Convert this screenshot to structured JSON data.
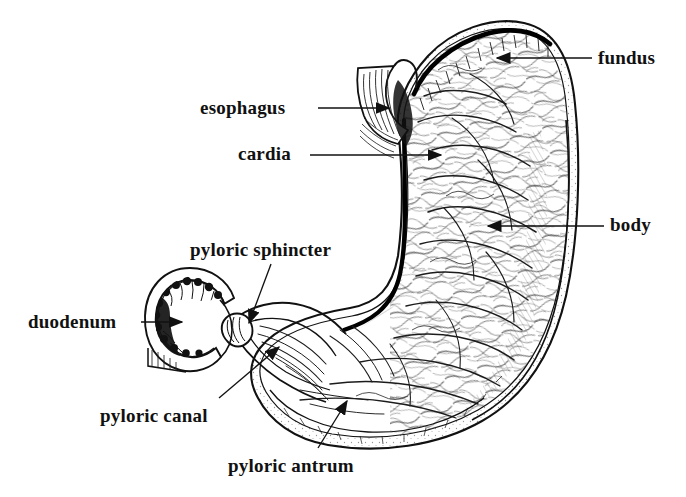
{
  "figure": {
    "background_color": "#ffffff",
    "ink_color": "#111111",
    "style": "black-and-white engraved line drawing with hatching and stippling"
  },
  "labels": [
    {
      "id": "fundus",
      "text": "fundus",
      "x": 598,
      "y": 48,
      "align": "left",
      "leader": {
        "from_x": 592,
        "from_y": 58,
        "to_x": 495,
        "to_y": 58,
        "arrow": "left"
      }
    },
    {
      "id": "esophagus",
      "text": "esophagus",
      "x": 200,
      "y": 98,
      "align": "left",
      "leader": {
        "from_x": 318,
        "from_y": 108,
        "to_x": 391,
        "to_y": 108,
        "arrow": "right"
      }
    },
    {
      "id": "cardia",
      "text": "cardia",
      "x": 238,
      "y": 144,
      "align": "left",
      "leader": {
        "from_x": 310,
        "from_y": 155,
        "to_x": 443,
        "to_y": 155,
        "arrow": "right"
      }
    },
    {
      "id": "body",
      "text": "body",
      "x": 610,
      "y": 215,
      "align": "left",
      "leader": {
        "from_x": 604,
        "from_y": 226,
        "to_x": 486,
        "to_y": 226,
        "arrow": "left"
      }
    },
    {
      "id": "pyloric-sphincter",
      "text": "pyloric sphincter",
      "x": 190,
      "y": 240,
      "align": "left",
      "leader": {
        "from_x": 271,
        "from_y": 264,
        "to_x": 247,
        "to_y": 326,
        "arrow": "down-left"
      }
    },
    {
      "id": "duodenum",
      "text": "duodenum",
      "x": 28,
      "y": 312,
      "align": "left",
      "leader": {
        "from_x": 141,
        "from_y": 322,
        "to_x": 184,
        "to_y": 322,
        "arrow": "right"
      }
    },
    {
      "id": "pyloric-canal",
      "text": "pyloric canal",
      "x": 100,
      "y": 406,
      "align": "left",
      "leader": {
        "from_x": 219,
        "from_y": 398,
        "to_x": 281,
        "to_y": 344,
        "arrow": "up-right"
      }
    },
    {
      "id": "pyloric-antrum",
      "text": "pyloric antrum",
      "x": 228,
      "y": 456,
      "align": "left",
      "leader": {
        "from_x": 318,
        "from_y": 448,
        "to_x": 348,
        "to_y": 398,
        "arrow": "up-right"
      }
    }
  ]
}
